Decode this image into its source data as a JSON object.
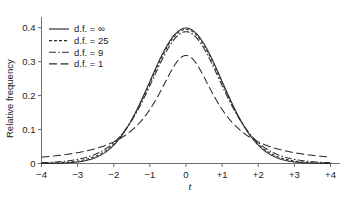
{
  "chart_data": {
    "type": "line",
    "title": "",
    "subtitle": "",
    "xlabel": "t",
    "ylabel": "Relative frequency",
    "xlim": [
      -4,
      4
    ],
    "ylim": [
      0,
      0.43
    ],
    "grid": false,
    "legend_position": "upper-left",
    "xticks": [
      -4,
      -3,
      -2,
      -1,
      0,
      1,
      2,
      3,
      4
    ],
    "xtick_labels": [
      "−4",
      "−3",
      "−2",
      "−1",
      "0",
      "+1",
      "+2",
      "+3",
      "+4"
    ],
    "yticks": [
      0,
      0.1,
      0.2,
      0.3,
      0.4
    ],
    "ytick_labels": [
      "0",
      "0.1",
      "0.2",
      "0.3",
      "0.4"
    ],
    "x": [
      -4,
      -3.75,
      -3.5,
      -3.25,
      -3,
      -2.75,
      -2.5,
      -2.25,
      -2,
      -1.75,
      -1.5,
      -1.25,
      -1,
      -0.75,
      -0.5,
      -0.25,
      0,
      0.25,
      0.5,
      0.75,
      1,
      1.25,
      1.5,
      1.75,
      2,
      2.25,
      2.5,
      2.75,
      3,
      3.25,
      3.5,
      3.75,
      4
    ],
    "series": [
      {
        "name": "d.f. = ∞",
        "df": "infinity",
        "linestyle": "solid",
        "peak": 0.3989,
        "values": [
          0.0001,
          0.0004,
          0.0009,
          0.002,
          0.0044,
          0.0091,
          0.0175,
          0.0317,
          0.054,
          0.0863,
          0.1295,
          0.1826,
          0.242,
          0.3011,
          0.3521,
          0.3867,
          0.3989,
          0.3867,
          0.3521,
          0.3011,
          0.242,
          0.1826,
          0.1295,
          0.0863,
          0.054,
          0.0317,
          0.0175,
          0.0091,
          0.0044,
          0.002,
          0.0009,
          0.0004,
          0.0001
        ]
      },
      {
        "name": "d.f. = 25",
        "df": 25,
        "linestyle": "dashed",
        "peak": 0.3956,
        "values": [
          0.0005,
          0.001,
          0.0019,
          0.0036,
          0.0065,
          0.0116,
          0.02,
          0.0335,
          0.0542,
          0.0847,
          0.1271,
          0.18,
          0.2396,
          0.2992,
          0.3501,
          0.3838,
          0.3956,
          0.3838,
          0.3501,
          0.2992,
          0.2396,
          0.18,
          0.1271,
          0.0847,
          0.0542,
          0.0335,
          0.02,
          0.0116,
          0.0065,
          0.0036,
          0.0019,
          0.001,
          0.0005
        ]
      },
      {
        "name": "d.f. = 9",
        "df": 9,
        "linestyle": "dash-dot",
        "peak": 0.3801,
        "values": [
          0.0023,
          0.0036,
          0.0058,
          0.0092,
          0.0146,
          0.023,
          0.0355,
          0.0533,
          0.0767,
          0.1051,
          0.1459,
          0.1941,
          0.2477,
          0.3011,
          0.3453,
          0.3732,
          0.3801,
          0.3732,
          0.3453,
          0.3011,
          0.2477,
          0.1941,
          0.1459,
          0.1051,
          0.0767,
          0.0533,
          0.0355,
          0.023,
          0.0146,
          0.0092,
          0.0058,
          0.0036,
          0.0023
        ]
      },
      {
        "name": "d.f. = 1",
        "df": 1,
        "linestyle": "long-dash",
        "peak": 0.3183,
        "values": [
          0.0187,
          0.0212,
          0.0242,
          0.0279,
          0.0318,
          0.0372,
          0.0439,
          0.0525,
          0.0637,
          0.0784,
          0.0979,
          0.1238,
          0.1592,
          0.2037,
          0.2546,
          0.2996,
          0.3183,
          0.2996,
          0.2546,
          0.2037,
          0.1592,
          0.1238,
          0.0979,
          0.0784,
          0.0637,
          0.0525,
          0.0439,
          0.0372,
          0.0318,
          0.0279,
          0.0242,
          0.0212,
          0.0187
        ]
      }
    ],
    "annotations": [],
    "colors": {
      "line": "#2b2b2b",
      "axis": "#6e6e6e",
      "text": "#1b1b1b",
      "background": "#ffffff"
    }
  },
  "legend": {
    "entries": [
      {
        "label": "d.f. = ∞"
      },
      {
        "label": "d.f. = 25"
      },
      {
        "label": "d.f. = 9"
      },
      {
        "label": "d.f. = 1"
      }
    ]
  },
  "axes": {
    "y_title": "Relative frequency",
    "x_title": "t"
  }
}
